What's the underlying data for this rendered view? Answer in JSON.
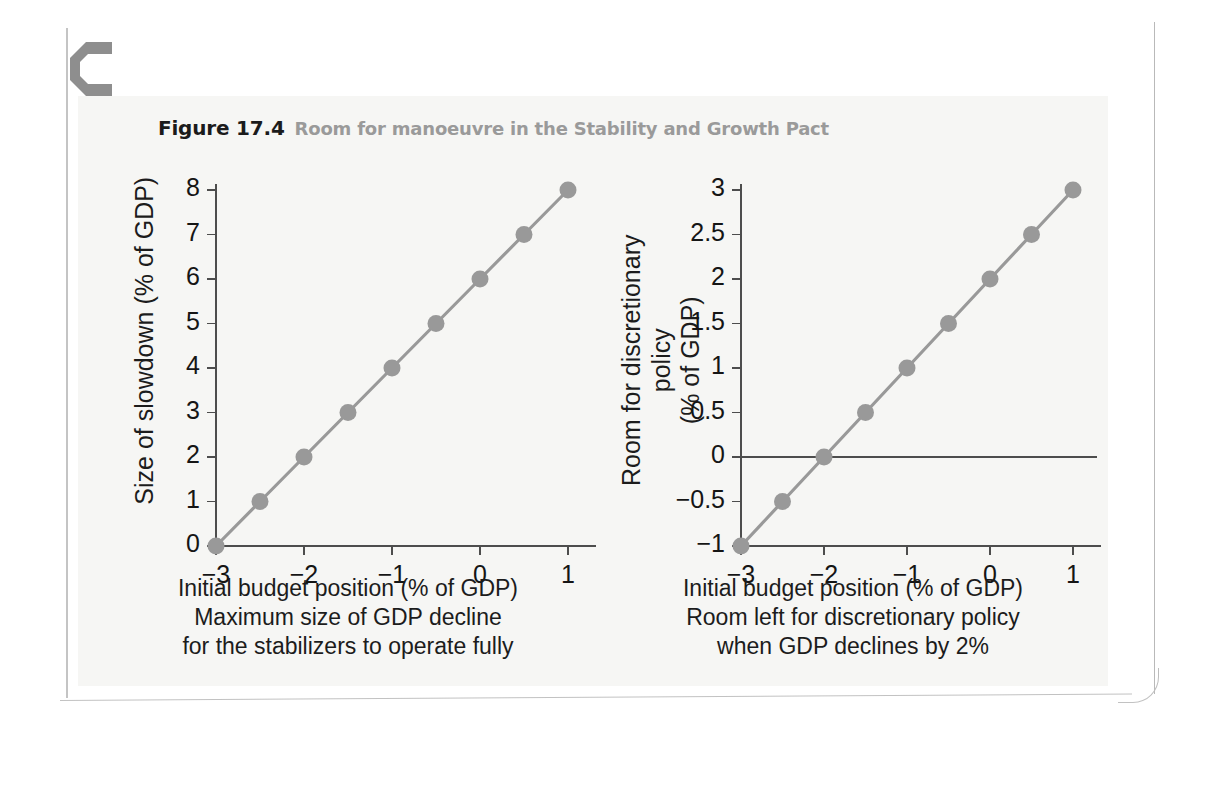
{
  "page": {
    "chapter_mark_letter": "C"
  },
  "caption": {
    "figure_number": "Figure 17.4",
    "title": "Room for manoeuvre in the Stability and Growth Pact"
  },
  "bleed": {
    "left_ghost": "",
    "right_ghost": ""
  },
  "colors": {
    "series": "#999999",
    "axis": "#4d4d4d",
    "text": "#1c1c1c",
    "caption_gray": "#9a9a9a",
    "panel_bg": "#f6f6f4"
  },
  "chart_data": [
    {
      "id": "left",
      "type": "line",
      "title": "",
      "xlabel": "Initial budget position (% of GDP)",
      "xcaption_lines": [
        "Initial budget position (% of GDP)",
        "Maximum size of GDP decline",
        "for the stabilizers to operate fully"
      ],
      "ylabel": "Size of slowdown (% of GDP)",
      "xlim": [
        -3,
        1
      ],
      "ylim": [
        0,
        8
      ],
      "xticks": [
        -3,
        -2,
        -1,
        0,
        1
      ],
      "xticklabels": [
        "−3",
        "−2",
        "−1",
        "0",
        "1"
      ],
      "yticks": [
        0,
        1,
        2,
        3,
        4,
        5,
        6,
        7,
        8
      ],
      "yticklabels": [
        "0",
        "1",
        "2",
        "3",
        "4",
        "5",
        "6",
        "7",
        "8"
      ],
      "grid": false,
      "legend": "none",
      "zero_line": false,
      "x": [
        -3,
        -2.5,
        -2,
        -1.5,
        -1,
        -0.5,
        0,
        0.5,
        1
      ],
      "y": [
        0,
        1,
        2,
        3,
        4,
        5,
        6,
        7,
        8
      ],
      "marker": "circle"
    },
    {
      "id": "right",
      "type": "line",
      "title": "",
      "xlabel": "Initial budget position (% of GDP)",
      "xcaption_lines": [
        "Initial budget position (% of GDP)",
        "Room left for discretionary policy",
        "when GDP declines by 2%"
      ],
      "ylabel": "Room for discretionary policy\n(% of GDP)",
      "xlim": [
        -3,
        1
      ],
      "ylim": [
        -1,
        3
      ],
      "xticks": [
        -3,
        -2,
        -1,
        0,
        1
      ],
      "xticklabels": [
        "−3",
        "−2",
        "−1",
        "0",
        "1"
      ],
      "yticks": [
        -1,
        -0.5,
        0,
        0.5,
        1,
        1.5,
        2,
        2.5,
        3
      ],
      "yticklabels": [
        "−1",
        "−0.5",
        "0",
        "0.5",
        "1",
        "1.5",
        "2",
        "2.5",
        "3"
      ],
      "grid": false,
      "legend": "none",
      "zero_line": true,
      "x": [
        -3,
        -2.5,
        -2,
        -1.5,
        -1,
        -0.5,
        0,
        0.5,
        1
      ],
      "y": [
        -1,
        -0.5,
        0,
        0.5,
        1,
        1.5,
        2,
        2.5,
        3
      ],
      "marker": "circle"
    }
  ]
}
